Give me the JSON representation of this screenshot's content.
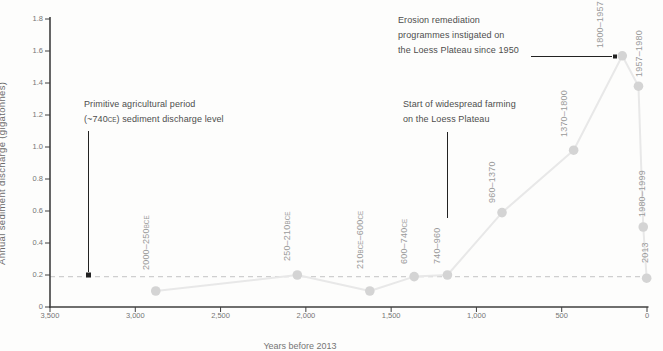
{
  "chart_data": {
    "type": "line",
    "xlabel": "Years before 2013",
    "ylabel": "Annual sediment discharge (gigatonnes)",
    "x_axis_reversed": true,
    "grid": false,
    "xlim": [
      3500,
      0
    ],
    "ylim": [
      0,
      1.8
    ],
    "x_tick_labels": [
      "3,500",
      "3,000",
      "2,500",
      "2,000",
      "1,500",
      "1,000",
      "500",
      "0"
    ],
    "x_tick_values": [
      3500,
      3000,
      2500,
      2000,
      1500,
      1000,
      500,
      0
    ],
    "y_tick_labels": [
      "0",
      "0.2",
      "0.4",
      "0.6",
      "0.8",
      "1.0",
      "1.2",
      "1.4",
      "1.6",
      "1.8"
    ],
    "y_tick_values": [
      0,
      0.2,
      0.4,
      0.6,
      0.8,
      1.0,
      1.2,
      1.4,
      1.6,
      1.8
    ],
    "points": [
      {
        "period": "2000–250BCE",
        "years_before_2013": 2880,
        "value": 0.1
      },
      {
        "period": "250–210BCE",
        "years_before_2013": 2050,
        "value": 0.2
      },
      {
        "period": "210BCE–600CE",
        "years_before_2013": 1625,
        "value": 0.1
      },
      {
        "period": "600–740CE",
        "years_before_2013": 1365,
        "value": 0.19
      },
      {
        "period": "740–960",
        "years_before_2013": 1170,
        "value": 0.2
      },
      {
        "period": "960–1370",
        "years_before_2013": 850,
        "value": 0.59
      },
      {
        "period": "1370–1800",
        "years_before_2013": 430,
        "value": 0.98
      },
      {
        "period": "1800–1957",
        "years_before_2013": 145,
        "value": 1.57
      },
      {
        "period": "1957–1980",
        "years_before_2013": 50,
        "value": 1.38
      },
      {
        "period": "1980–1999",
        "years_before_2013": 22,
        "value": 0.5
      },
      {
        "period": "2013",
        "years_before_2013": 2,
        "value": 0.18
      }
    ],
    "reference_line": {
      "value": 0.19,
      "style": "dashed",
      "meaning": "Primitive agricultural period (~740CE) sediment discharge level"
    },
    "annotations": [
      {
        "id": "primitive-level",
        "lines": [
          "Primitive agricultural period",
          "(~740CE) sediment discharge level"
        ]
      },
      {
        "id": "widespread-farming",
        "lines": [
          "Start of widespread farming",
          "on the Loess Plateau"
        ]
      },
      {
        "id": "erosion-remediation",
        "lines": [
          "Erosion remediation",
          "programmes instigated on",
          "the Loess Plateau since 1950"
        ]
      }
    ],
    "colors": {
      "axis": "#3f3f3f",
      "tick_label": "#757575",
      "data_line": "#e8e8e8",
      "data_point": "#d4d4d4",
      "reference_line": "#cfcfcf",
      "period_label": "#9a9a9a",
      "annotation_text": "#4d4d4d",
      "annotation_line": "#222222"
    }
  }
}
